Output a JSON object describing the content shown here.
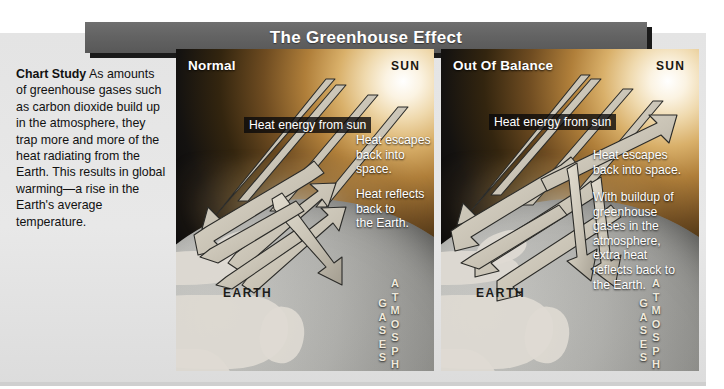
{
  "title": "The Greenhouse Effect",
  "study": {
    "lead": "Chart Study",
    "body": " As amounts of greenhouse gases such as carbon dioxide build up in the atmosphere, they trap more and more of the heat radiating from the Earth. This results in global warming—a rise in the Earth's average temperature."
  },
  "panels": [
    {
      "key": "normal",
      "title": "Normal",
      "sun_label": "SUN",
      "heat_band": "Heat energy from sun",
      "caption_escape": "Heat escapes\nback into\nspace.",
      "caption_reflect": "Heat reflects\nback to\nthe Earth.",
      "earth_label": "EARTH",
      "atmosphere_label": "ATMOSPHERIC GASES"
    },
    {
      "key": "out-of-balance",
      "title": "Out Of Balance",
      "sun_label": "SUN",
      "heat_band": "Heat energy from sun",
      "caption_escape": "Heat escapes\nback into space.",
      "caption_reflect": "With buildup of\ngreenhouse\ngases in the\natmosphere,\nextra heat\nreflects back to\nthe Earth.",
      "earth_label": "EARTH",
      "atmosphere_label": "ATMOSPHERIC GASES"
    }
  ],
  "colors": {
    "banner": "#636363",
    "paper": "#e4e4e4",
    "sky_dark": "#0b0b0c",
    "sun_glow": "#fbf3e2",
    "arrow_fill": "#cfc9bb",
    "arrow_stroke": "#2a2a28"
  }
}
